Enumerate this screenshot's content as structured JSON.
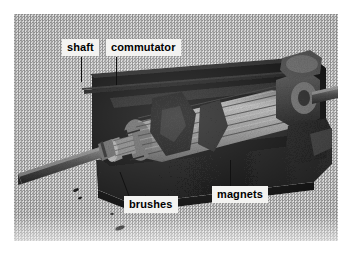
{
  "figure": {
    "kind": "photograph-diagram",
    "palette": {
      "paper": "#ffffff",
      "scan_gray": "#c4c4c4",
      "ink_black": "#111111",
      "label_box": "#f3f3f1",
      "label_text": "#000000"
    }
  },
  "labels": {
    "shaft": "shaft",
    "commutator": "commutator",
    "brushes": "brushes",
    "magnets": "magnets"
  }
}
